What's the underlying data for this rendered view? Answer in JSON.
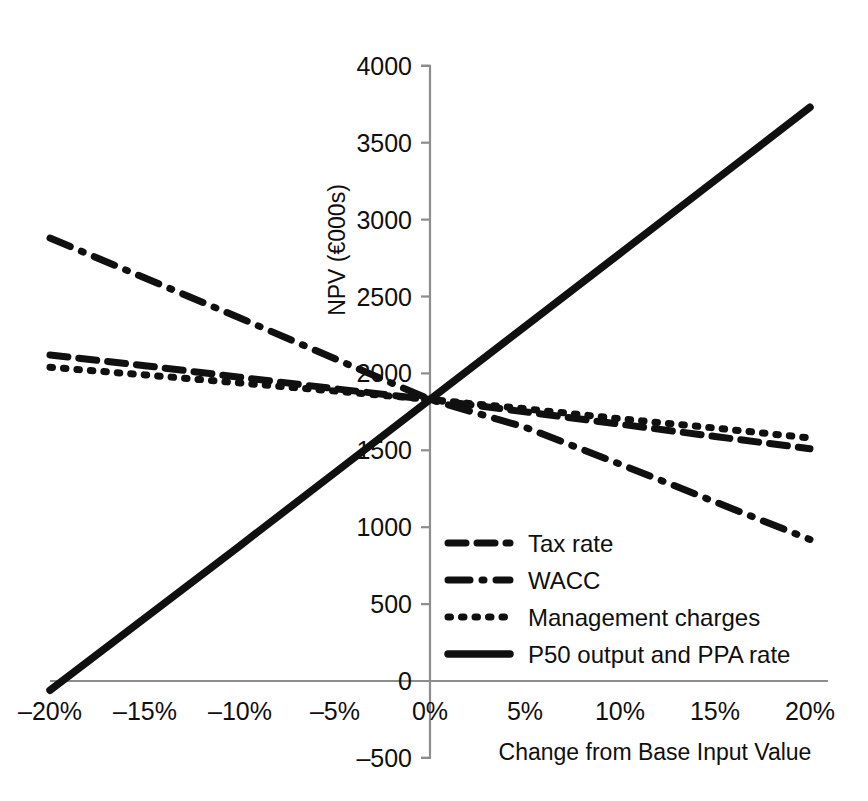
{
  "figure": {
    "top_partial_text": " ",
    "bottom_caption": " "
  },
  "chart_data": {
    "type": "line",
    "title": "",
    "xlabel": "Change from Base Input Value",
    "ylabel": "NPV (€000s)",
    "x": [
      -20,
      -15,
      -10,
      -5,
      0,
      5,
      10,
      15,
      20
    ],
    "xtick_labels": [
      "–20%",
      "–15%",
      "–10%",
      "–5%",
      "0%",
      "5%",
      "10%",
      "15%",
      "20%"
    ],
    "xlim": [
      -20,
      20
    ],
    "ylim": [
      -500,
      4000
    ],
    "yticks": [
      -500,
      0,
      500,
      1000,
      1500,
      2000,
      2500,
      3000,
      3500,
      4000
    ],
    "ytick_labels": [
      "–500",
      "0",
      "500",
      "1000",
      "1500",
      "2000",
      "2500",
      "3000",
      "3500",
      "4000"
    ],
    "grid": false,
    "legend_position": "center-right-inside",
    "series": [
      {
        "name": "Tax rate",
        "style": "dashed",
        "values": [
          2120,
          2050,
          1975,
          1900,
          1830,
          1750,
          1670,
          1590,
          1510
        ]
      },
      {
        "name": "WACC",
        "style": "dash-dot",
        "values": [
          2880,
          2620,
          2360,
          2095,
          1830,
          1650,
          1410,
          1165,
          920
        ]
      },
      {
        "name": "Management charges",
        "style": "dotted",
        "values": [
          2040,
          1990,
          1938,
          1885,
          1830,
          1770,
          1705,
          1645,
          1580
        ]
      },
      {
        "name": "P50 output and PPA rate",
        "style": "solid",
        "values": [
          -60,
          410,
          880,
          1355,
          1830,
          2305,
          2780,
          3255,
          3730
        ]
      }
    ]
  },
  "legend": {
    "items": [
      {
        "label": "Tax rate",
        "style": "dashed"
      },
      {
        "label": "WACC",
        "style": "dash-dot"
      },
      {
        "label": "Management charges",
        "style": "dotted"
      },
      {
        "label": "P50 output and PPA rate",
        "style": "solid"
      }
    ]
  }
}
